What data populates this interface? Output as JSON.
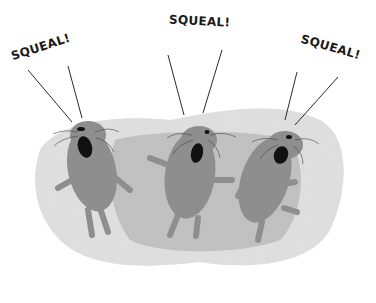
{
  "illustration": {
    "description": "Three squealing mole-like creatures on a grey stippled background",
    "labels": [
      {
        "text": "SQUEAL!",
        "x": 10,
        "y": 34,
        "rotate": -18
      },
      {
        "text": "SQUEAL!",
        "x": 169,
        "y": 14,
        "rotate": 3
      },
      {
        "text": "SQUEAL!",
        "x": 299,
        "y": 38,
        "rotate": 16
      }
    ],
    "colors": {
      "background": "#ffffff",
      "stipple": "#b9b9b9",
      "body": "#8e8e8e",
      "mouth": "#111111",
      "line": "#2a2a2a"
    }
  }
}
